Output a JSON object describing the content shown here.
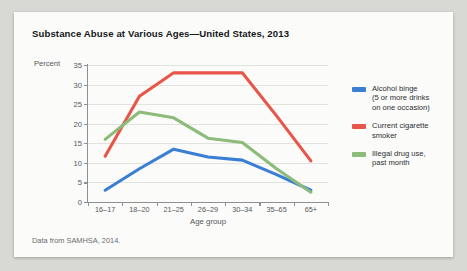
{
  "figure": {
    "title": "Substance Abuse at Various Ages—United States, 2013",
    "source_note": "Data from SAMHSA, 2014."
  },
  "axes": {
    "y_axis_label": "Percent",
    "x_axis_label": "Age group",
    "y_ticks": [
      "0",
      "5",
      "10",
      "15",
      "20",
      "25",
      "30",
      "35"
    ]
  },
  "legend": {
    "items": [
      {
        "label": "Alcohol binge\n(5 or more drinks\non one occasion)",
        "color": "#3b7fd4"
      },
      {
        "label": "Current cigarette\nsmoker",
        "color": "#e8564a"
      },
      {
        "label": "Illegal drug use,\npast month",
        "color": "#8cbb7a"
      }
    ]
  },
  "chart_data": {
    "type": "line",
    "title": "Substance Abuse at Various Ages—United States, 2013",
    "xlabel": "Age group",
    "ylabel": "Percent",
    "ylim": [
      0,
      35
    ],
    "ytick_step": 5,
    "grid": true,
    "legend_position": "right",
    "categories": [
      "16–17",
      "18–20",
      "21–25",
      "26–29",
      "30–34",
      "35–65",
      "65+"
    ],
    "series": [
      {
        "name": "Alcohol binge (5 or more drinks on one occasion)",
        "color": "#3b7fd4",
        "values": [
          3.0,
          8.5,
          13.5,
          11.5,
          10.7,
          7.0,
          3.0
        ]
      },
      {
        "name": "Current cigarette smoker",
        "color": "#e8564a",
        "values": [
          11.7,
          27.0,
          33.0,
          33.0,
          33.0,
          22.0,
          10.5
        ]
      },
      {
        "name": "Illegal drug use, past month",
        "color": "#8cbb7a",
        "values": [
          16.0,
          23.0,
          21.5,
          16.3,
          15.2,
          8.5,
          2.5
        ]
      }
    ]
  }
}
